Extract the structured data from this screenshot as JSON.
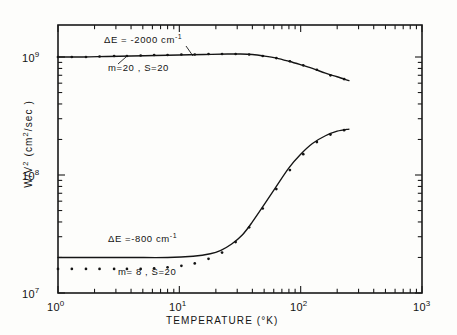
{
  "figure": {
    "name": "nonradiative-decay-rate-vs-temperature",
    "background_color": "#fdfdfb",
    "ink_color": "#141414"
  },
  "chart_data": {
    "type": "line",
    "title": "",
    "xlabel": "TEMPERATURE (°K)",
    "ylabel": "W/V² (cm²/sec)",
    "xscale": "log",
    "yscale": "log",
    "xlim": [
      1,
      1000
    ],
    "ylim": [
      10000000,
      2000000000
    ],
    "grid": false,
    "legend_position": "inline-annotations",
    "x_tick_labels": [
      "10⁰",
      "10¹",
      "10²",
      "10³"
    ],
    "x_tick_values": [
      1,
      10,
      100,
      1000
    ],
    "y_tick_labels": [
      "10⁷",
      "10⁸",
      "10⁹"
    ],
    "y_tick_values": [
      10000000,
      100000000,
      1000000000
    ],
    "series": [
      {
        "name": "dE = -2000 cm-1, m=20, S=20 (theory line)",
        "style": "solid",
        "x": [
          1.0,
          1.6,
          2.5,
          4.0,
          6.3,
          10.0,
          16.0,
          25.0,
          32.0,
          40.0,
          50.0,
          63.0,
          80.0,
          100.0,
          125.0,
          160.0,
          200.0,
          250.0
        ],
        "y": [
          1000000000.0,
          1000000000.0,
          1010000000.0,
          1020000000.0,
          1030000000.0,
          1040000000.0,
          1050000000.0,
          1060000000.0,
          1060000000.0,
          1050000000.0,
          1020000000.0,
          980000000.0,
          920000000.0,
          860000000.0,
          800000000.0,
          730000000.0,
          680000000.0,
          630000000.0
        ]
      },
      {
        "name": "dE = -2000 cm-1, m=20, S=20 (points)",
        "style": "dotted",
        "x": [
          1.0,
          1.3,
          1.7,
          2.2,
          2.9,
          3.7,
          4.8,
          6.2,
          8.0,
          10.4,
          13.4,
          17.4,
          22.5,
          29.1,
          37.6,
          48.7,
          63.0,
          81.5,
          105.0,
          136.0,
          176.0,
          228.0
        ],
        "y": [
          1000000000.0,
          1000000000.0,
          1000000000.0,
          1010000000.0,
          1020000000.0,
          1020000000.0,
          1030000000.0,
          1040000000.0,
          1040000000.0,
          1050000000.0,
          1050000000.0,
          1060000000.0,
          1060000000.0,
          1060000000.0,
          1050000000.0,
          1020000000.0,
          980000000.0,
          920000000.0,
          850000000.0,
          780000000.0,
          700000000.0,
          650000000.0
        ]
      },
      {
        "name": "dE = -800 cm-1, m=8, S=20 (theory line)",
        "style": "solid",
        "x": [
          1.0,
          2.0,
          4.0,
          8.0,
          13.0,
          18.0,
          22.0,
          27.0,
          33.0,
          40.0,
          50.0,
          63.0,
          80.0,
          100.0,
          125.0,
          160.0,
          200.0,
          250.0
        ],
        "y": [
          20000000.0,
          20000000.0,
          20000000.0,
          20000000.0,
          20500000.0,
          21500000.0,
          23000000.0,
          26000000.0,
          31000000.0,
          40000000.0,
          56000000.0,
          80000000.0,
          115000000.0,
          150000000.0,
          185000000.0,
          215000000.0,
          235000000.0,
          245000000.0
        ]
      },
      {
        "name": "dE = -800 cm-1, m=8, S=20 (points)",
        "style": "dotted",
        "x": [
          1.0,
          1.3,
          1.7,
          2.2,
          2.9,
          3.7,
          4.8,
          6.2,
          8.0,
          10.4,
          13.4,
          17.4,
          22.5,
          29.1,
          37.6,
          48.7,
          63.0,
          81.5,
          105.0,
          136.0,
          176.0,
          228.0
        ],
        "y": [
          16000000.0,
          16000000.0,
          16000000.0,
          16000000.0,
          16000000.0,
          16000000.0,
          16000000.0,
          16200000.0,
          16500000.0,
          17000000.0,
          17800000.0,
          19500000.0,
          22000000.0,
          27000000.0,
          36000000.0,
          52000000.0,
          76000000.0,
          110000000.0,
          150000000.0,
          190000000.0,
          220000000.0,
          240000000.0
        ]
      }
    ],
    "annotations": [
      {
        "id": "upper-energy-gap",
        "text": "ΔE = -2000 cm",
        "sup": "-1",
        "x_px": 104,
        "y_px": 39
      },
      {
        "id": "upper-params",
        "text": "m=20 , S=20",
        "sup": "",
        "x_px": 108,
        "y_px": 68
      },
      {
        "id": "lower-energy-gap",
        "text": "ΔE =-800 cm",
        "sup": "-1",
        "x_px": 108,
        "y_px": 238
      },
      {
        "id": "lower-params",
        "text": "m= 8 , S=20",
        "sup": "",
        "x_px": 118,
        "y_px": 272
      }
    ]
  },
  "axes": {
    "x_title": "TEMPERATURE (°K)",
    "y_title_main": "W/V",
    "y_title_sup": "2",
    "y_title_rest": " (cm",
    "y_title_sup2": "2",
    "y_title_tail": "/sec )",
    "x_labels": [
      {
        "mant": "10",
        "exp": "0"
      },
      {
        "mant": "10",
        "exp": "1"
      },
      {
        "mant": "10",
        "exp": "2"
      },
      {
        "mant": "10",
        "exp": "3"
      }
    ],
    "y_labels": [
      {
        "mant": "10",
        "exp": "9"
      },
      {
        "mant": "10",
        "exp": "8"
      },
      {
        "mant": "10",
        "exp": "7"
      }
    ]
  }
}
